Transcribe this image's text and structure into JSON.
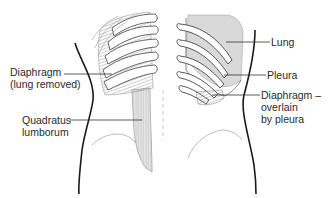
{
  "figure": {
    "colors": {
      "background": "#ffffff",
      "outline": "#1a1a1a",
      "lung_fill": "#d9d9d9",
      "muscle_fill": "#c8c8c8",
      "label_line": "#333333"
    },
    "labels": {
      "diaphragm_left_line1": "Diaphragm",
      "diaphragm_left_line2": "(lung removed)",
      "quadratus_line1": "Quadratus",
      "quadratus_line2": "lumborum",
      "lung": "Lung",
      "pleura": "Pleura",
      "diaphragm_right_line1": "Diaphragm –",
      "diaphragm_right_line2": "overlain",
      "diaphragm_right_line3": "by pleura"
    }
  }
}
